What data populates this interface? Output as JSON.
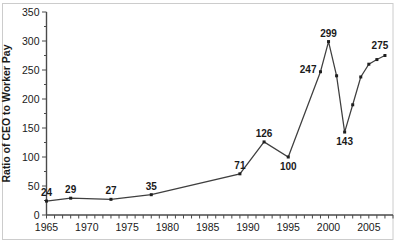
{
  "chart_data": {
    "type": "line",
    "ylabel": "Ratio of CEO to Worker Pay",
    "xlabel": "",
    "x_range": [
      1965,
      2008
    ],
    "ylim": [
      0,
      350
    ],
    "y_major_step": 50,
    "y_minor_step": 25,
    "x_tick_step": 1,
    "x_label_ticks": [
      1965,
      1970,
      1975,
      1980,
      1985,
      1990,
      1995,
      2000,
      2005
    ],
    "y_label_ticks": [
      0,
      50,
      100,
      150,
      200,
      250,
      300,
      350
    ],
    "grid": false,
    "legend": "none",
    "series": [
      {
        "name": "CEO-to-worker pay ratio",
        "points": [
          {
            "x": 1965,
            "y": 24,
            "label": "24",
            "label_pos": "above"
          },
          {
            "x": 1968,
            "y": 29,
            "label": "29",
            "label_pos": "above"
          },
          {
            "x": 1973,
            "y": 27,
            "label": "27",
            "label_pos": "above"
          },
          {
            "x": 1978,
            "y": 35,
            "label": "35",
            "label_pos": "above"
          },
          {
            "x": 1989,
            "y": 71,
            "label": "71",
            "label_pos": "above"
          },
          {
            "x": 1992,
            "y": 126,
            "label": "126",
            "label_pos": "above"
          },
          {
            "x": 1995,
            "y": 100,
            "label": "100",
            "label_pos": "below"
          },
          {
            "x": 1999,
            "y": 247,
            "label": "247",
            "label_pos": "left"
          },
          {
            "x": 2000,
            "y": 299,
            "label": "299",
            "label_pos": "above"
          },
          {
            "x": 2001,
            "y": 240
          },
          {
            "x": 2002,
            "y": 143,
            "label": "143",
            "label_pos": "below"
          },
          {
            "x": 2003,
            "y": 190
          },
          {
            "x": 2004,
            "y": 238
          },
          {
            "x": 2005,
            "y": 260
          },
          {
            "x": 2006,
            "y": 268
          },
          {
            "x": 2007,
            "y": 275,
            "label": "275",
            "label_pos": "above-left"
          }
        ]
      }
    ],
    "colors": {
      "background": "#ffffff",
      "border": "#cccccc",
      "axis": "#4a4a4a",
      "tick_text": "#1a1a1a",
      "line": "#3f3f3f",
      "marker": "#1f1f1f",
      "data_label": "#000000"
    }
  }
}
